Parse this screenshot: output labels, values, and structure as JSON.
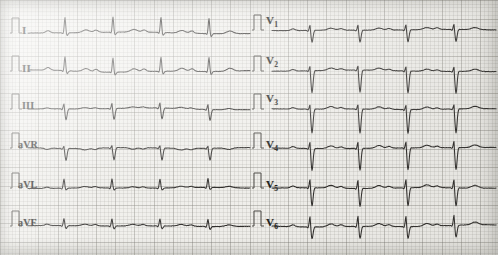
{
  "document": {
    "type": "12-lead-ecg",
    "paper_color": "#efeeea",
    "grid_color": "#78766e",
    "trace_color": "#2e2c2a",
    "width": 498,
    "height": 255
  },
  "leads": {
    "limb": [
      {
        "id": "I",
        "label": "I",
        "sub": ""
      },
      {
        "id": "II",
        "label": "II",
        "sub": ""
      },
      {
        "id": "III",
        "label": "III",
        "sub": ""
      },
      {
        "id": "aVR",
        "label": "aVR",
        "sub": ""
      },
      {
        "id": "aVL",
        "label": "aVL",
        "sub": ""
      },
      {
        "id": "aVF",
        "label": "aVF",
        "sub": ""
      }
    ],
    "precordial": [
      {
        "id": "V1",
        "label": "V",
        "sub": "1"
      },
      {
        "id": "V2",
        "label": "V",
        "sub": "2"
      },
      {
        "id": "V3",
        "label": "V",
        "sub": "3"
      },
      {
        "id": "V4",
        "label": "V",
        "sub": "4"
      },
      {
        "id": "V5",
        "label": "V",
        "sub": "5"
      },
      {
        "id": "V6",
        "label": "V",
        "sub": "6"
      }
    ]
  },
  "chart_data": {
    "type": "line",
    "xlabel": "Time",
    "ylabel": "Amplitude (mV)",
    "grid": true,
    "legend": "none",
    "paper_speed": "25 mm/s",
    "calibration": "10 mm/mV",
    "beats_per_strip": 4,
    "series": [
      {
        "name": "I",
        "column": "left",
        "baseline_y": 33,
        "qrs_x": [
          65,
          113,
          161,
          209
        ],
        "r_amp": -15,
        "s_amp": 3,
        "p_amp": -2.2,
        "t_amp": -2.6
      },
      {
        "name": "II",
        "column": "left",
        "baseline_y": 71,
        "qrs_x": [
          65,
          113,
          161,
          209
        ],
        "r_amp": -14,
        "s_amp": 3,
        "p_amp": -2.6,
        "t_amp": -3.0
      },
      {
        "name": "III",
        "column": "left",
        "baseline_y": 109,
        "qrs_x": [
          64,
          112,
          160,
          208
        ],
        "r_amp": -5,
        "s_amp": 11,
        "p_amp": -1.0,
        "t_amp": -1.2
      },
      {
        "name": "aVR",
        "column": "left",
        "baseline_y": 148,
        "qrs_x": [
          64,
          112,
          160,
          208
        ],
        "r_amp": -2,
        "s_amp": 12,
        "p_amp": 1.4,
        "t_amp": 1.6
      },
      {
        "name": "aVL",
        "column": "left",
        "baseline_y": 188,
        "qrs_x": [
          64,
          112,
          160,
          208
        ],
        "r_amp": -9,
        "s_amp": 2,
        "p_amp": -1.2,
        "t_amp": -1.4
      },
      {
        "name": "aVF",
        "column": "left",
        "baseline_y": 226,
        "qrs_x": [
          64,
          112,
          160,
          208
        ],
        "r_amp": -7,
        "s_amp": 3,
        "p_amp": -1.4,
        "t_amp": -1.6
      },
      {
        "name": "V1",
        "column": "right",
        "baseline_y": 30,
        "qrs_x": [
          310,
          358,
          406,
          454
        ],
        "r_amp": -5,
        "s_amp": 12,
        "p_amp": -1.6,
        "t_amp": -2.0
      },
      {
        "name": "V2",
        "column": "right",
        "baseline_y": 71,
        "qrs_x": [
          310,
          358,
          406,
          454
        ],
        "r_amp": -4,
        "s_amp": 22,
        "p_amp": -1.4,
        "t_amp": -2.2
      },
      {
        "name": "V3",
        "column": "right",
        "baseline_y": 109,
        "qrs_x": [
          310,
          358,
          406,
          454
        ],
        "r_amp": -4,
        "s_amp": 24,
        "p_amp": -1.4,
        "t_amp": -2.4
      },
      {
        "name": "V4",
        "column": "right",
        "baseline_y": 148,
        "qrs_x": [
          310,
          358,
          406,
          454
        ],
        "r_amp": -6,
        "s_amp": 22,
        "p_amp": -1.6,
        "t_amp": -2.6
      },
      {
        "name": "V5",
        "column": "right",
        "baseline_y": 188,
        "qrs_x": [
          310,
          358,
          406,
          454
        ],
        "r_amp": -8,
        "s_amp": 18,
        "p_amp": -1.8,
        "t_amp": -2.8
      },
      {
        "name": "V6",
        "column": "right",
        "baseline_y": 226,
        "qrs_x": [
          310,
          358,
          406,
          454
        ],
        "r_amp": -10,
        "s_amp": 12,
        "p_amp": -1.8,
        "t_amp": -2.8
      }
    ]
  },
  "label_positions": {
    "limb": [
      [
        22,
        24
      ],
      [
        22,
        62
      ],
      [
        22,
        100
      ],
      [
        18,
        139
      ],
      [
        18,
        179
      ],
      [
        18,
        217
      ]
    ],
    "precordial": [
      [
        266,
        14
      ],
      [
        266,
        54
      ],
      [
        266,
        92
      ],
      [
        266,
        138
      ],
      [
        266,
        178
      ],
      [
        266,
        216
      ]
    ]
  },
  "calibration_marks": {
    "limb_x": 10,
    "precordial_x": 252,
    "description": "1 mV standardization step"
  }
}
